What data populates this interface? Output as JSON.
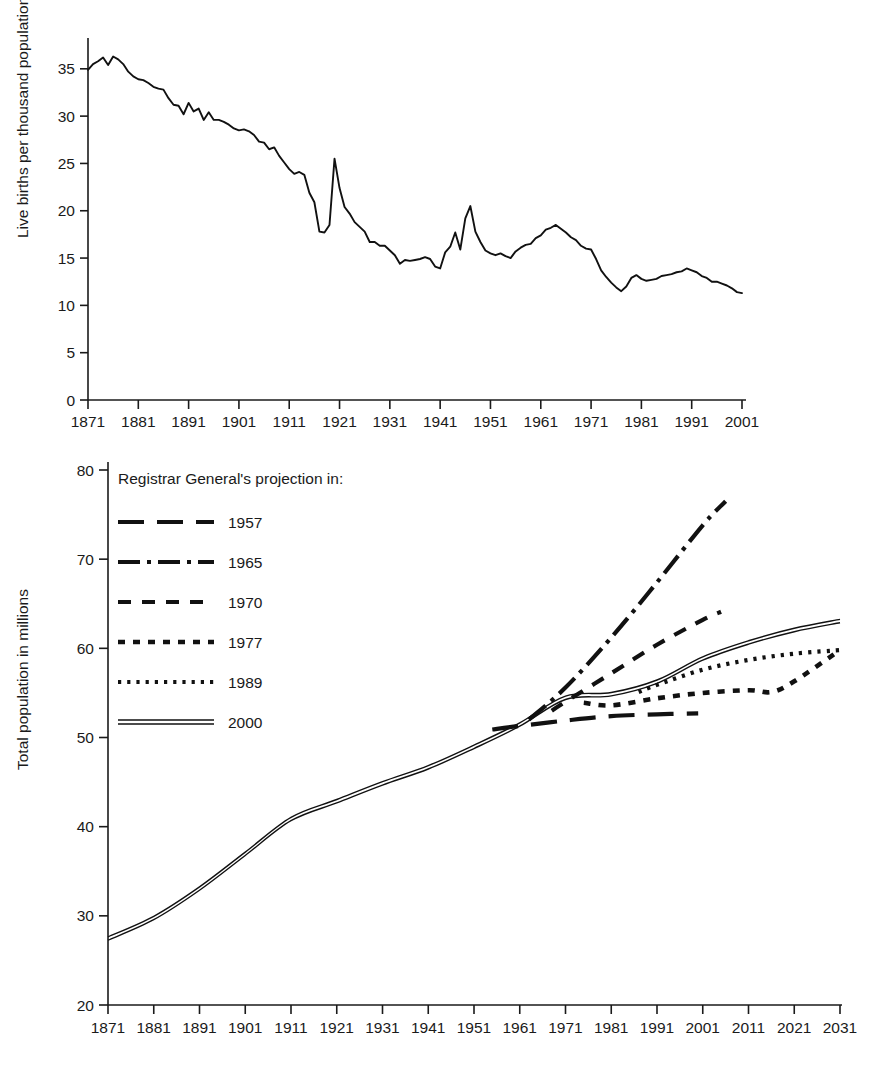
{
  "page": {
    "background": "#ffffff",
    "ink_color": "#111111"
  },
  "chart_data": [
    {
      "id": "birth-rate",
      "type": "line",
      "title": "",
      "xlabel": "",
      "ylabel": "Live births per thousand population",
      "xlim": [
        1871,
        2001
      ],
      "ylim": [
        0,
        37
      ],
      "yticks": [
        0,
        5,
        10,
        15,
        20,
        25,
        30,
        35
      ],
      "xticks": [
        1871,
        1881,
        1891,
        1901,
        1911,
        1921,
        1931,
        1941,
        1951,
        1961,
        1971,
        1981,
        1991,
        2001
      ],
      "grid": false,
      "legend": "none",
      "series": [
        {
          "name": "Live birth rate",
          "x": [
            1871,
            1872,
            1873,
            1874,
            1875,
            1876,
            1877,
            1878,
            1879,
            1880,
            1881,
            1882,
            1883,
            1884,
            1885,
            1886,
            1887,
            1888,
            1889,
            1890,
            1891,
            1892,
            1893,
            1894,
            1895,
            1896,
            1897,
            1898,
            1899,
            1900,
            1901,
            1902,
            1903,
            1904,
            1905,
            1906,
            1907,
            1908,
            1909,
            1910,
            1911,
            1912,
            1913,
            1914,
            1915,
            1916,
            1917,
            1918,
            1919,
            1920,
            1921,
            1922,
            1923,
            1924,
            1925,
            1926,
            1927,
            1928,
            1929,
            1930,
            1931,
            1932,
            1933,
            1934,
            1935,
            1936,
            1937,
            1938,
            1939,
            1940,
            1941,
            1942,
            1943,
            1944,
            1945,
            1946,
            1947,
            1948,
            1949,
            1950,
            1951,
            1952,
            1953,
            1954,
            1955,
            1956,
            1957,
            1958,
            1959,
            1960,
            1961,
            1962,
            1963,
            1964,
            1965,
            1966,
            1967,
            1968,
            1969,
            1970,
            1971,
            1972,
            1973,
            1974,
            1975,
            1976,
            1977,
            1978,
            1979,
            1980,
            1981,
            1982,
            1983,
            1984,
            1985,
            1986,
            1987,
            1988,
            1989,
            1990,
            1991,
            1992,
            1993,
            1994,
            1995,
            1996,
            1997,
            1998,
            1999,
            2000,
            2001
          ],
          "values": [
            34.9,
            35.5,
            35.8,
            36.2,
            35.4,
            36.3,
            36.0,
            35.5,
            34.7,
            34.2,
            33.9,
            33.8,
            33.5,
            33.1,
            32.9,
            32.8,
            31.9,
            31.2,
            31.1,
            30.2,
            31.4,
            30.5,
            30.8,
            29.6,
            30.4,
            29.6,
            29.6,
            29.4,
            29.1,
            28.7,
            28.5,
            28.6,
            28.4,
            28.0,
            27.3,
            27.2,
            26.5,
            26.7,
            25.8,
            25.1,
            24.4,
            23.9,
            24.1,
            23.8,
            21.9,
            20.9,
            17.8,
            17.7,
            18.5,
            25.5,
            22.4,
            20.4,
            19.7,
            18.8,
            18.3,
            17.8,
            16.7,
            16.7,
            16.3,
            16.3,
            15.8,
            15.3,
            14.4,
            14.8,
            14.7,
            14.8,
            14.9,
            15.1,
            14.9,
            14.1,
            13.9,
            15.6,
            16.2,
            17.7,
            15.9,
            19.2,
            20.5,
            17.8,
            16.7,
            15.8,
            15.5,
            15.3,
            15.5,
            15.2,
            15.0,
            15.7,
            16.1,
            16.4,
            16.5,
            17.1,
            17.4,
            18.0,
            18.2,
            18.5,
            18.1,
            17.7,
            17.2,
            16.9,
            16.3,
            16.0,
            15.9,
            14.9,
            13.7,
            13.0,
            12.4,
            11.9,
            11.5,
            12.0,
            12.9,
            13.2,
            12.8,
            12.6,
            12.7,
            12.8,
            13.1,
            13.2,
            13.3,
            13.5,
            13.6,
            13.9,
            13.7,
            13.5,
            13.1,
            12.9,
            12.5,
            12.5,
            12.3,
            12.1,
            11.8,
            11.4,
            11.3
          ],
          "style": "solid"
        }
      ]
    },
    {
      "id": "population",
      "type": "line",
      "title": "",
      "xlabel": "",
      "ylabel": "Total population in millions",
      "xlim": [
        1871,
        2031
      ],
      "ylim": [
        20,
        80
      ],
      "yticks": [
        20,
        30,
        40,
        50,
        60,
        70,
        80
      ],
      "xticks": [
        1871,
        1881,
        1891,
        1901,
        1911,
        1921,
        1931,
        1941,
        1951,
        1961,
        1971,
        1981,
        1991,
        2001,
        2011,
        2021,
        2031
      ],
      "grid": false,
      "legend": "inside-top-left",
      "legend_title": "Registrar General's projection in:",
      "series": [
        {
          "name": "2000",
          "legend_label": "2000",
          "style": "double-solid",
          "x": [
            1871,
            1881,
            1891,
            1901,
            1911,
            1921,
            1931,
            1941,
            1951,
            1961,
            1971,
            1981,
            1991,
            2001,
            2011,
            2021,
            2031
          ],
          "values": [
            27.4,
            29.7,
            33.0,
            36.9,
            40.8,
            42.8,
            44.8,
            46.6,
            48.9,
            51.4,
            54.4,
            54.8,
            56.2,
            58.8,
            60.6,
            62.0,
            63.0
          ]
        },
        {
          "name": "1957",
          "legend_label": "1957",
          "style": "long-dash",
          "x": [
            1955,
            1961,
            1971,
            1981,
            1991,
            2000
          ],
          "values": [
            50.9,
            51.3,
            51.9,
            52.4,
            52.6,
            52.7
          ]
        },
        {
          "name": "1965",
          "legend_label": "1965",
          "style": "dash-dot",
          "x": [
            1963,
            1971,
            1981,
            1991,
            2001,
            2006
          ],
          "values": [
            52.0,
            55.6,
            61.2,
            67.4,
            73.8,
            76.5
          ]
        },
        {
          "name": "1970",
          "legend_label": "1970",
          "style": "medium-dash",
          "x": [
            1968,
            1971,
            1981,
            1991,
            2001,
            2005
          ],
          "values": [
            53.0,
            54.0,
            57.2,
            60.4,
            63.2,
            64.1
          ]
        },
        {
          "name": "1977",
          "legend_label": "1977",
          "style": "short-dash",
          "x": [
            1975,
            1981,
            1991,
            2001,
            2011,
            2016,
            2021,
            2031
          ],
          "values": [
            53.9,
            53.6,
            54.4,
            55.0,
            55.3,
            55.1,
            56.3,
            59.8
          ]
        },
        {
          "name": "1989",
          "legend_label": "1989",
          "style": "dotted",
          "x": [
            1987,
            1991,
            2001,
            2011,
            2021,
            2031
          ],
          "values": [
            55.1,
            55.9,
            57.6,
            58.7,
            59.4,
            59.8
          ]
        }
      ]
    }
  ],
  "top_chart": {
    "y_axis_title": "Live births per thousand population",
    "y_tick_labels": [
      "35",
      "30",
      "25",
      "20",
      "15",
      "10",
      "5",
      "0"
    ],
    "x_tick_labels": [
      "1871",
      "1881",
      "1891",
      "1901",
      "1911",
      "1921",
      "1931",
      "1941",
      "1951",
      "1961",
      "1971",
      "1981",
      "1991",
      "2001"
    ]
  },
  "bottom_chart": {
    "y_axis_title": "Total population in millions",
    "y_tick_labels": [
      "80",
      "70",
      "60",
      "50",
      "40",
      "30",
      "20"
    ],
    "x_tick_labels": [
      "1871",
      "1881",
      "1891",
      "1901",
      "1911",
      "1921",
      "1931",
      "1941",
      "1951",
      "1961",
      "1971",
      "1981",
      "1991",
      "2001",
      "2011",
      "2021",
      "2031"
    ],
    "legend": {
      "title": "Registrar General's projection in:",
      "items": [
        {
          "label": "1957",
          "style": "long-dash"
        },
        {
          "label": "1965",
          "style": "dash-dot"
        },
        {
          "label": "1970",
          "style": "medium-dash"
        },
        {
          "label": "1977",
          "style": "short-dash"
        },
        {
          "label": "1989",
          "style": "dotted"
        },
        {
          "label": "2000",
          "style": "double-solid"
        }
      ]
    }
  }
}
